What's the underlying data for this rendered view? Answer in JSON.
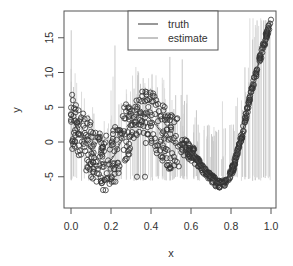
{
  "chart_data": {
    "type": "scatter",
    "title": "",
    "xlabel": "x",
    "ylabel": "y",
    "xlim": [
      0.0,
      1.0
    ],
    "ylim": [
      -7,
      18
    ],
    "x_ticks": [
      "0.0",
      "0.2",
      "0.4",
      "0.6",
      "0.8",
      "1.0"
    ],
    "y_ticks": [
      "-5",
      "0",
      "5",
      "10",
      "15"
    ],
    "grid": false,
    "legend_position": "top-center",
    "legend": [
      {
        "label": "truth",
        "style": "solid",
        "color": "#333333"
      },
      {
        "label": "estimate",
        "style": "solid",
        "color": "#888888"
      }
    ],
    "series": [
      {
        "name": "truth",
        "type": "line",
        "x": [
          0.0,
          0.05,
          0.1,
          0.15,
          0.2,
          0.25,
          0.3,
          0.35,
          0.4,
          0.45,
          0.5,
          0.55,
          0.6,
          0.65,
          0.7,
          0.75,
          0.8,
          0.85,
          0.9,
          0.95,
          1.0
        ],
        "y": [
          3.0,
          1.2,
          -1.0,
          -2.8,
          -2.6,
          0.0,
          2.8,
          4.0,
          3.2,
          1.5,
          0.0,
          -0.5,
          -1.5,
          -3.5,
          -5.2,
          -6.0,
          -4.5,
          0.5,
          7.0,
          12.5,
          17.0
        ]
      },
      {
        "name": "estimate",
        "type": "line-dashed",
        "x": [
          0.0,
          0.05,
          0.1,
          0.15,
          0.2,
          0.25,
          0.3,
          0.35,
          0.4,
          0.45,
          0.5,
          0.55,
          0.6,
          0.65,
          0.7,
          0.75,
          0.8,
          0.85,
          0.9,
          0.95,
          1.0
        ],
        "y": [
          3.2,
          1.0,
          -1.2,
          -3.0,
          -2.4,
          0.4,
          3.2,
          4.2,
          3.4,
          1.8,
          0.3,
          -0.3,
          -1.6,
          -3.6,
          -5.1,
          -5.9,
          -4.4,
          0.6,
          7.2,
          12.7,
          17.4
        ]
      },
      {
        "name": "observations",
        "type": "scatter",
        "marker": "open-circle",
        "description": "Dense cluster of open-circle observations with vertical interval bars; large spread for x<0.55, tightly along curve for x>0.55"
      }
    ]
  }
}
